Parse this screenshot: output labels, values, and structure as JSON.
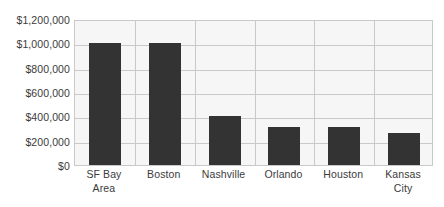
{
  "chart_data": {
    "type": "bar",
    "title": "",
    "subtitle": "",
    "xlabel": "",
    "ylabel": "",
    "categories": [
      "SF Bay Area",
      "Boston",
      "Nashville",
      "Orlando",
      "Houston",
      "Kansas City"
    ],
    "category_lines": [
      [
        "SF Bay",
        "Area"
      ],
      [
        "Boston"
      ],
      [
        "Nashville"
      ],
      [
        "Orlando"
      ],
      [
        "Houston"
      ],
      [
        "Kansas",
        "City"
      ]
    ],
    "values": [
      1000000,
      1000000,
      405000,
      310000,
      310000,
      265000
    ],
    "ylim": [
      0,
      1200000
    ],
    "yticks": [
      0,
      200000,
      400000,
      600000,
      800000,
      1000000,
      1200000
    ],
    "ytick_labels": [
      "$0",
      "$200,000",
      "$400,000",
      "$600,000",
      "$800,000",
      "$1,000,000",
      "$1,200,000"
    ],
    "grid": {
      "horizontal": true,
      "vertical": true
    },
    "legend": {
      "visible": false,
      "position": "none",
      "entries": []
    },
    "colors": {
      "bar_fill": "#333333",
      "plot_background": "#f6f6f6",
      "gridline": "#c9c9c9",
      "plot_border": "#c9c9c9",
      "axis_text": "#3b3b3b",
      "page_background": "#ffffff"
    }
  }
}
